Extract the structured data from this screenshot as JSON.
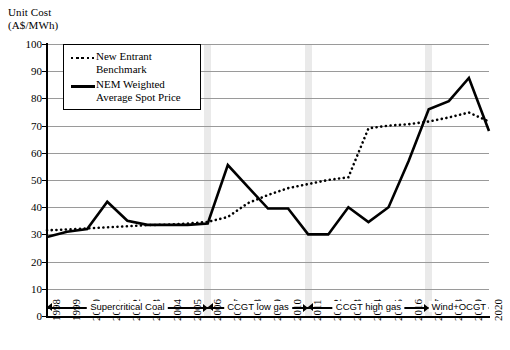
{
  "chart_data": {
    "type": "line",
    "ylabel_line1": "Unit Cost",
    "ylabel_line2": "(A$/MWh)",
    "xlabel": "",
    "ylim": [
      0,
      100
    ],
    "ytick_step": 10,
    "yticks": [
      0,
      10,
      20,
      30,
      40,
      50,
      60,
      70,
      80,
      90,
      100
    ],
    "grid": true,
    "legend_position": "top-left",
    "categories": [
      "1998",
      "1999",
      "2000",
      "2001",
      "2002",
      "2003",
      "2004",
      "2005",
      "2006",
      "2007",
      "2008",
      "2009",
      "2010",
      "2011",
      "2012",
      "2013",
      "2014",
      "2015",
      "2016",
      "2017",
      "2018",
      "2019",
      "2020"
    ],
    "series": [
      {
        "name": "New Entrant Benchmark",
        "style": "dotted",
        "color": "#000000",
        "values": [
          31.5,
          31.8,
          32.2,
          32.6,
          33.0,
          33.4,
          33.6,
          34.0,
          34.6,
          36.4,
          41.5,
          44.5,
          47.0,
          48.5,
          50.0,
          51.0,
          69.0,
          70.0,
          70.5,
          71.5,
          73.0,
          74.8,
          71.5
        ]
      },
      {
        "name": "NEM Weighted Average Spot Price",
        "style": "solid",
        "color": "#000000",
        "values": [
          29.0,
          31.0,
          32.0,
          42.0,
          35.0,
          33.5,
          33.5,
          33.5,
          34.0,
          34.0,
          33.5,
          29.5,
          33.0,
          34.0,
          55.5,
          47.5,
          39.5,
          39.5,
          30.0,
          40.0,
          34.5,
          40.0,
          60.0
        ]
      }
    ],
    "series_note_correction": {
      "NEM Weighted Average Spot Price": [
        29.0,
        31.0,
        32.0,
        42.0,
        35.0,
        33.5,
        33.5,
        33.5,
        34.0,
        55.5,
        47.5,
        39.5,
        39.5,
        30.0,
        30.0,
        40.0,
        34.5,
        40.0,
        57.0,
        76.0,
        79.0,
        87.5,
        68.0
      ]
    },
    "annotations": [
      {
        "label": "Supercritical Coal",
        "start": "1998",
        "end": "2006"
      },
      {
        "label": "CCGT low gas",
        "start": "2006",
        "end": "2011"
      },
      {
        "label": "CCGT high gas",
        "start": "2011",
        "end": "2017"
      },
      {
        "label": "Wind+OCGT",
        "start": "2017",
        "end": "2020"
      }
    ],
    "band_years": [
      "2006",
      "2011",
      "2017"
    ]
  },
  "legend": {
    "entries": [
      {
        "label": "New Entrant\nBenchmark",
        "style": "dotted"
      },
      {
        "label": "NEM Weighted\nAverage Spot Price",
        "style": "solid"
      }
    ]
  },
  "colors": {
    "gridline": "#9a9a9a",
    "axis": "#000000",
    "band": "#d9d9d9",
    "series": "#000000"
  }
}
